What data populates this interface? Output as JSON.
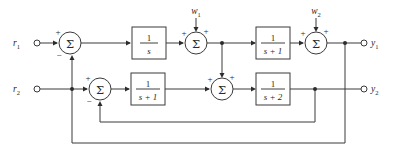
{
  "diagram": {
    "type": "control-system-block-diagram",
    "background_color": "#ffffff",
    "line_color": "#3a3a3a",
    "inputs": [
      {
        "id": "r1",
        "label": "r",
        "subscript": "1",
        "x": 22,
        "y": 43,
        "terminal_x": 40
      },
      {
        "id": "r2",
        "label": "r",
        "subscript": "2",
        "x": 22,
        "y": 89,
        "terminal_x": 40
      }
    ],
    "disturbances": [
      {
        "id": "w1",
        "label": "w",
        "subscript": "1",
        "x": 196,
        "y": 11,
        "enters_node": "sum-w1",
        "sign": "+"
      },
      {
        "id": "w2",
        "label": "w",
        "subscript": "2",
        "x": 316,
        "y": 11,
        "enters_node": "sum-w2",
        "sign": "+"
      }
    ],
    "outputs": [
      {
        "id": "y1",
        "label": "y",
        "subscript": "1",
        "x": 374,
        "y": 43,
        "terminal_x": 364
      },
      {
        "id": "y2",
        "label": "y",
        "subscript": "2",
        "x": 374,
        "y": 89,
        "terminal_x": 364
      }
    ],
    "sum_nodes": [
      {
        "id": "sum-r1",
        "cx": 70,
        "cy": 43,
        "r": 11,
        "glyph": "Σ",
        "signs": [
          {
            "text": "+",
            "x": 58,
            "y": 32
          },
          {
            "text": "−",
            "x": 59,
            "y": 55
          }
        ]
      },
      {
        "id": "sum-w1",
        "cx": 196,
        "cy": 43,
        "r": 11,
        "glyph": "Σ",
        "signs": [
          {
            "text": "+",
            "x": 184,
            "y": 33
          },
          {
            "text": "+",
            "x": 206,
            "y": 31
          }
        ]
      },
      {
        "id": "sum-w2",
        "cx": 316,
        "cy": 43,
        "r": 11,
        "glyph": "Σ",
        "signs": [
          {
            "text": "+",
            "x": 303,
            "y": 33
          },
          {
            "text": "+",
            "x": 326,
            "y": 31
          }
        ]
      },
      {
        "id": "sum-r2",
        "cx": 100,
        "cy": 89,
        "r": 11,
        "glyph": "Σ",
        "signs": [
          {
            "text": "+",
            "x": 88,
            "y": 78
          },
          {
            "text": "−",
            "x": 89,
            "y": 101
          }
        ]
      },
      {
        "id": "sum-mid",
        "cx": 222,
        "cy": 89,
        "r": 11,
        "glyph": "Σ",
        "signs": [
          {
            "text": "+",
            "x": 210,
            "y": 79
          },
          {
            "text": "+",
            "x": 232,
            "y": 77
          }
        ]
      }
    ],
    "blocks": [
      {
        "id": "block-1s",
        "x": 132,
        "y": 27,
        "w": 34,
        "h": 32,
        "numerator": "1",
        "denominator": "s"
      },
      {
        "id": "block-1sp1-top",
        "x": 256,
        "y": 27,
        "w": 34,
        "h": 32,
        "numerator": "1",
        "denominator": "s + 1"
      },
      {
        "id": "block-1sp1-bottom",
        "x": 131,
        "y": 73,
        "w": 34,
        "h": 32,
        "numerator": "1",
        "denominator": "s + 1"
      },
      {
        "id": "block-1sp2",
        "x": 256,
        "y": 73,
        "w": 34,
        "h": 32,
        "numerator": "1",
        "denominator": "s + 2"
      }
    ],
    "junction_dots": [
      {
        "id": "dot-top-branch",
        "cx": 222,
        "cy": 43,
        "r": 2
      },
      {
        "id": "dot-y1-branch",
        "cx": 345,
        "cy": 43,
        "r": 2
      },
      {
        "id": "dot-y2-branch",
        "cx": 315,
        "cy": 89,
        "r": 2
      },
      {
        "id": "dot-r2-cross",
        "cx": 72,
        "cy": 89,
        "r": 2
      }
    ],
    "feedback_paths": [
      {
        "id": "feedback-inner",
        "from": "dot-y2-branch",
        "to": "sum-r2",
        "bottom_y": 122,
        "sign": "−"
      },
      {
        "id": "feedback-outer",
        "from": "dot-y1-branch",
        "to": "sum-r1",
        "bottom_y": 143,
        "sign": "−"
      }
    ]
  }
}
